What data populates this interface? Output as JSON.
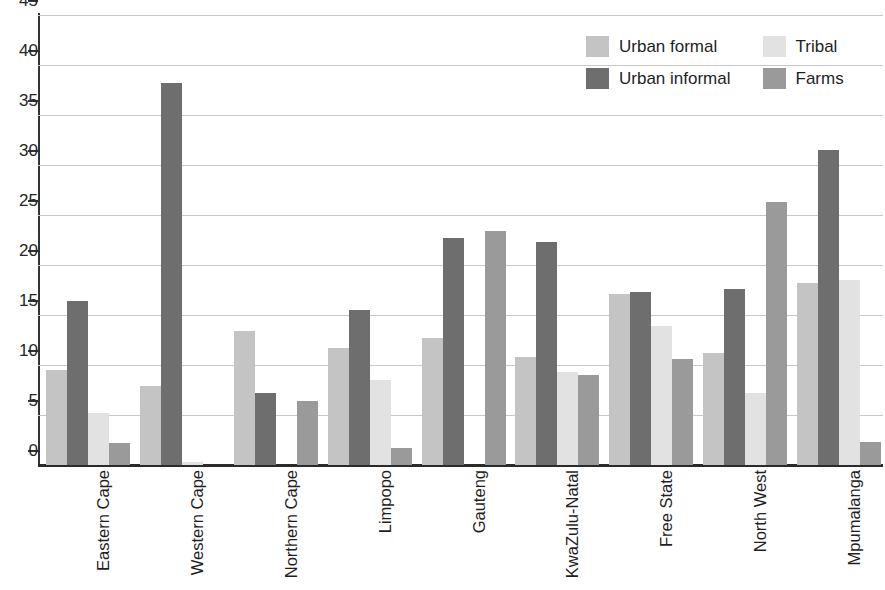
{
  "chart_data": {
    "type": "bar",
    "title": "",
    "subtitle": "",
    "xlabel": "",
    "ylabel": "",
    "ylim": [
      0,
      45
    ],
    "ytick_step": 5,
    "yticks": [
      0,
      5,
      10,
      15,
      20,
      25,
      30,
      35,
      40,
      45
    ],
    "grid": true,
    "grid_axis": "y",
    "legend_position": "top-right",
    "legend_columns": 2,
    "categories": [
      "Eastern Cape",
      "Western Cape",
      "Northern Cape",
      "Limpopo",
      "Gauteng",
      "KwaZulu-Natal",
      "Free State",
      "North West",
      "Mpumalanga"
    ],
    "series": [
      {
        "name": "Urban formal",
        "color": "#c4c4c4",
        "values": [
          9.5,
          7.9,
          13.4,
          11.7,
          12.7,
          10.8,
          17.1,
          11.2,
          18.2
        ]
      },
      {
        "name": "Urban informal",
        "color": "#6e6e6e",
        "values": [
          16.4,
          38.2,
          7.2,
          15.5,
          22.7,
          22.3,
          17.3,
          17.6,
          31.5
        ]
      },
      {
        "name": "Tribal",
        "color": "#e2e2e2",
        "values": [
          5.2,
          0.3,
          0.0,
          8.5,
          0.0,
          9.3,
          13.9,
          7.2,
          18.5
        ]
      },
      {
        "name": "Farms",
        "color": "#9a9a9a",
        "values": [
          2.2,
          0.0,
          6.4,
          1.7,
          23.4,
          9.0,
          10.6,
          26.3,
          2.3
        ]
      }
    ]
  },
  "legend": {
    "entries": [
      {
        "label": "Urban formal",
        "color": "#c4c4c4"
      },
      {
        "label": "Tribal",
        "color": "#e2e2e2"
      },
      {
        "label": "Urban informal",
        "color": "#6e6e6e"
      },
      {
        "label": "Farms",
        "color": "#9a9a9a"
      }
    ]
  },
  "axis": {
    "y_tick_labels": [
      "0",
      "5",
      "10",
      "15",
      "20",
      "25",
      "30",
      "35",
      "40",
      "45"
    ]
  },
  "colors": {
    "axis": "#2b2b2b",
    "grid": "#c8c8c8",
    "text": "#1f1f1f",
    "background": "#ffffff"
  }
}
